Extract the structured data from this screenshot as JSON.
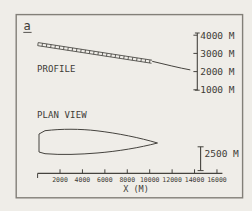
{
  "figure": {
    "panel_label": "a",
    "profile_label": "PROFILE",
    "plan_view_label": "PLAN VIEW"
  },
  "profile_scale": {
    "labels": [
      "4000 M",
      "3000 M",
      "2000 M",
      "1000 M"
    ]
  },
  "plan_scale": {
    "label": "2500 M"
  },
  "xaxis": {
    "title": "X (M)",
    "ticks": [
      "2000",
      "4000",
      "6000",
      "8000",
      "10000",
      "12000",
      "14000",
      "16000"
    ]
  },
  "colors": {
    "ink": "#45433e",
    "paper": "#efede8",
    "frame": "#827f78"
  },
  "chart_data": {
    "type": "line",
    "panel": "a",
    "title": "",
    "xlabel": "X (M)",
    "x_ticks": [
      2000,
      4000,
      6000,
      8000,
      10000,
      12000,
      14000,
      16000
    ],
    "x_range": [
      0,
      16500
    ],
    "series": [
      {
        "name": "PROFILE surface elevation (M)",
        "style": "line with ladder/hatch marking from x=0 to x≈10200, plain line beyond",
        "x": [
          0,
          2000,
          4000,
          6000,
          8000,
          10000,
          12000,
          13600
        ],
        "y": [
          3600,
          3400,
          3200,
          2950,
          2730,
          2500,
          2280,
          2100
        ],
        "y_scale_ticks_m": [
          1000,
          2000,
          3000,
          4000
        ]
      },
      {
        "name": "PLAN VIEW outline half-width (M)",
        "style": "closed elongated outline, blunt at x=0, pointed terminus",
        "x": [
          0,
          1000,
          3000,
          5000,
          7000,
          9000,
          10500
        ],
        "half_width": [
          1100,
          1300,
          1400,
          1350,
          1150,
          700,
          0
        ],
        "scale_bar_m": 2500
      }
    ],
    "legend": "none",
    "grid": false
  }
}
